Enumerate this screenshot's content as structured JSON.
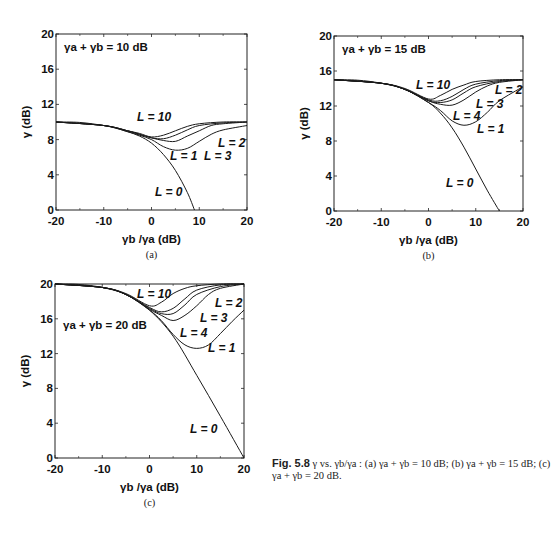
{
  "caption": {
    "fig_label": "Fig. 5.8",
    "text": " γ vs. γb/γa : (a) γa + γb = 10 dB; (b) γa + γb = 15 dB; (c) γa + γb = 20 dB."
  },
  "chart_data": [
    {
      "id": "a",
      "type": "line",
      "panel_label": "(a)",
      "annotation": "γa + γb = 10 dB",
      "xlabel": "γb /γa (dB)",
      "ylabel": "γ (dB)",
      "xlim": [
        -20,
        20
      ],
      "ylim": [
        0,
        20
      ],
      "xticks": [
        -20,
        -10,
        0,
        10,
        20
      ],
      "yticks": [
        0,
        4,
        8,
        12,
        16,
        20
      ],
      "grid": false,
      "box": {
        "x0": 56,
        "y0": 34,
        "x1": 247,
        "y1": 210
      },
      "series": [
        {
          "name": "L = 0",
          "x": [
            -20,
            -15,
            -10,
            -7.5,
            -5,
            -2.5,
            0,
            2.5,
            5,
            7.5,
            9
          ],
          "y": [
            10,
            9.95,
            9.6,
            9.3,
            8.9,
            8.4,
            7.6,
            6.3,
            4.5,
            2.0,
            0
          ]
        },
        {
          "name": "L = 1",
          "x": [
            -20,
            -10,
            -5,
            -2.5,
            0,
            2.5,
            5,
            7.5,
            10,
            12.5,
            15,
            20
          ],
          "y": [
            10,
            9.6,
            8.9,
            8.5,
            8.0,
            7.2,
            6.8,
            7.0,
            7.8,
            8.6,
            9.1,
            9.6
          ]
        },
        {
          "name": "L = 2",
          "x": [
            -20,
            -10,
            -5,
            -2.5,
            0,
            2.5,
            5,
            7.5,
            10,
            12.5,
            15,
            20
          ],
          "y": [
            10,
            9.6,
            9.0,
            8.6,
            8.2,
            7.9,
            7.8,
            8.4,
            9.0,
            9.6,
            9.8,
            10
          ]
        },
        {
          "name": "L = 3",
          "x": [
            -20,
            -10,
            -5,
            -2.5,
            0,
            2.5,
            5,
            7.5,
            10,
            15,
            20
          ],
          "y": [
            10,
            9.6,
            9.0,
            8.6,
            8.2,
            8.1,
            8.5,
            9.1,
            9.6,
            9.9,
            10
          ]
        },
        {
          "name": "L = 10",
          "x": [
            -20,
            -10,
            -5,
            -2.5,
            0,
            2.5,
            5,
            7.5,
            10,
            15,
            20
          ],
          "y": [
            10,
            9.6,
            9.0,
            8.7,
            8.3,
            8.5,
            9.0,
            9.5,
            9.8,
            10,
            10
          ]
        }
      ],
      "labels": [
        {
          "text": "L = 10",
          "x": 137,
          "y": 121
        },
        {
          "text": "L = 2",
          "x": 218,
          "y": 147
        },
        {
          "text": "L = 1",
          "x": 170,
          "y": 160
        },
        {
          "text": "L = 3",
          "x": 204,
          "y": 160
        },
        {
          "text": "L = 0",
          "x": 155,
          "y": 196
        }
      ]
    },
    {
      "id": "b",
      "type": "line",
      "panel_label": "(b)",
      "annotation": "γa + γb = 15 dB",
      "xlabel": "γb /γa (dB)",
      "ylabel": "γ (dB)",
      "xlim": [
        -20,
        20
      ],
      "ylim": [
        0,
        20
      ],
      "xticks": [
        -20,
        -10,
        0,
        10,
        20
      ],
      "yticks": [
        0,
        4,
        8,
        12,
        16,
        20
      ],
      "grid": false,
      "box": {
        "x0": 334,
        "y0": 36,
        "x1": 523,
        "y1": 211
      },
      "series": [
        {
          "name": "L = 0",
          "x": [
            -20,
            -15,
            -10,
            -5,
            0,
            2.5,
            5,
            7.5,
            10,
            12.5,
            15
          ],
          "y": [
            15,
            14.95,
            14.6,
            13.9,
            12.4,
            11.2,
            9.5,
            7.3,
            4.8,
            2.3,
            0
          ]
        },
        {
          "name": "L = 1",
          "x": [
            -20,
            -10,
            -5,
            0,
            2.5,
            5,
            7.5,
            10,
            12.5,
            15,
            20
          ],
          "y": [
            15,
            14.6,
            13.9,
            12.4,
            11.5,
            10.3,
            9.8,
            10.2,
            11.3,
            12.6,
            14.2
          ]
        },
        {
          "name": "L = 2",
          "x": [
            -20,
            -10,
            -5,
            0,
            2.5,
            5,
            7.5,
            10,
            12.5,
            15,
            20
          ],
          "y": [
            15,
            14.6,
            13.9,
            12.6,
            12.2,
            12.1,
            12.7,
            13.6,
            14.3,
            14.7,
            15
          ]
        },
        {
          "name": "L = 3",
          "x": [
            -20,
            -10,
            -5,
            0,
            2.5,
            5,
            7.5,
            10,
            15,
            20
          ],
          "y": [
            15,
            14.6,
            13.9,
            12.6,
            12.4,
            12.7,
            13.5,
            14.2,
            14.8,
            15
          ]
        },
        {
          "name": "L = 4",
          "x": [
            -20,
            -10,
            -5,
            0,
            2.5,
            5,
            7.5,
            10,
            15,
            20
          ],
          "y": [
            15,
            14.6,
            13.9,
            12.7,
            12.6,
            13.1,
            13.9,
            14.5,
            14.9,
            15
          ]
        },
        {
          "name": "L = 10",
          "x": [
            -20,
            -10,
            -5,
            0,
            2.5,
            5,
            7.5,
            10,
            15,
            20
          ],
          "y": [
            15,
            14.6,
            14.0,
            12.8,
            13.2,
            13.9,
            14.4,
            14.8,
            15,
            15
          ]
        }
      ],
      "labels": [
        {
          "text": "L = 10",
          "x": 416,
          "y": 89
        },
        {
          "text": "L = 2",
          "x": 495,
          "y": 94
        },
        {
          "text": "L = 3",
          "x": 476,
          "y": 108
        },
        {
          "text": "L = 4",
          "x": 453,
          "y": 120
        },
        {
          "text": "L = 1",
          "x": 477,
          "y": 133
        },
        {
          "text": "L = 0",
          "x": 446,
          "y": 187
        }
      ]
    },
    {
      "id": "c",
      "type": "line",
      "panel_label": "(c)",
      "annotation": "γa + γb = 20 dB",
      "xlabel": "γb /γa (dB)",
      "ylabel": "γ (dB)",
      "xlim": [
        -20,
        20
      ],
      "ylim": [
        0,
        20
      ],
      "xticks": [
        -20,
        -10,
        0,
        10,
        20
      ],
      "yticks": [
        0,
        4,
        8,
        12,
        16,
        20
      ],
      "grid": false,
      "box": {
        "x0": 55,
        "y0": 284,
        "x1": 244,
        "y1": 458
      },
      "series": [
        {
          "name": "L = 0",
          "x": [
            -20,
            -15,
            -10,
            -5,
            0,
            5,
            10,
            15,
            20
          ],
          "y": [
            20,
            19.95,
            19.6,
            18.8,
            17.0,
            14.0,
            9.5,
            4.8,
            0
          ]
        },
        {
          "name": "L = 1",
          "x": [
            -20,
            -10,
            -5,
            0,
            2.5,
            5,
            7.5,
            10,
            12.5,
            15,
            17.5,
            20
          ],
          "y": [
            20,
            19.6,
            18.8,
            17.0,
            15.8,
            14.2,
            13.0,
            12.6,
            13.0,
            14.3,
            15.7,
            17
          ]
        },
        {
          "name": "L = 2",
          "x": [
            -20,
            -10,
            -5,
            0,
            2.5,
            5,
            7.5,
            10,
            12.5,
            15,
            20
          ],
          "y": [
            20,
            19.6,
            18.8,
            17.1,
            16.4,
            15.8,
            16.4,
            17.5,
            18.8,
            19.5,
            20
          ]
        },
        {
          "name": "L = 3",
          "x": [
            -20,
            -10,
            -5,
            0,
            2.5,
            5,
            7.5,
            10,
            15,
            20
          ],
          "y": [
            20,
            19.6,
            18.8,
            17.2,
            16.6,
            16.6,
            17.6,
            18.8,
            19.7,
            20
          ]
        },
        {
          "name": "L = 4",
          "x": [
            -20,
            -10,
            -5,
            0,
            2.5,
            5,
            7.5,
            10,
            15,
            20
          ],
          "y": [
            20,
            19.6,
            18.8,
            17.3,
            16.8,
            17.2,
            18.3,
            19.3,
            19.9,
            20
          ]
        },
        {
          "name": "L = 10",
          "x": [
            -20,
            -10,
            -5,
            0,
            2.5,
            5,
            7.5,
            10,
            15,
            20
          ],
          "y": [
            20,
            19.6,
            18.9,
            17.5,
            17.9,
            18.9,
            19.5,
            19.8,
            20,
            20
          ]
        }
      ],
      "labels": [
        {
          "text": "L = 10",
          "x": 137,
          "y": 298
        },
        {
          "text": "L = 2",
          "x": 215,
          "y": 307
        },
        {
          "text": "L = 3",
          "x": 200,
          "y": 322
        },
        {
          "text": "L = 4",
          "x": 180,
          "y": 337
        },
        {
          "text": "L = 1",
          "x": 208,
          "y": 352
        },
        {
          "text": "L = 0",
          "x": 190,
          "y": 433
        }
      ]
    }
  ]
}
